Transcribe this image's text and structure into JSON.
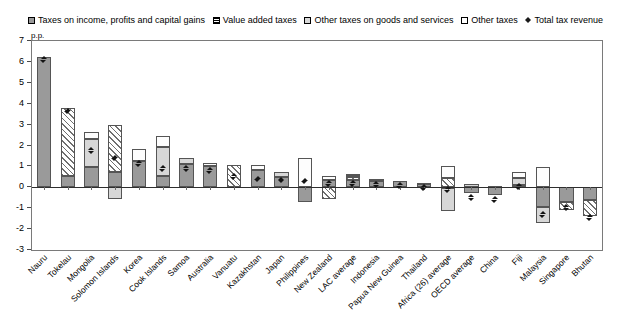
{
  "legend": {
    "items": [
      {
        "label": "Taxes on income, profits and capital gains",
        "marker": "square-hatch-icon",
        "key": "income"
      },
      {
        "label": "Value added taxes",
        "marker": "square-lines-icon",
        "key": "vat"
      },
      {
        "label": "Other taxes on goods and services",
        "marker": "square-grey-icon",
        "key": "goods"
      },
      {
        "label": "Other taxes",
        "marker": "square-white-icon",
        "key": "other"
      },
      {
        "label": "Total tax revenue",
        "marker": "diamond-icon",
        "key": "total"
      }
    ]
  },
  "axis": {
    "unit_label": "p.p.",
    "y_ticks": [
      "7",
      "6",
      "5",
      "4",
      "3",
      "2",
      "1",
      "0",
      "-1",
      "-2",
      "-3"
    ]
  },
  "chart_data": {
    "type": "bar",
    "title": "",
    "xlabel": "",
    "ylabel": "p.p.",
    "ylim": [
      -3,
      7
    ],
    "grid": false,
    "stacked": true,
    "legend_position": "top",
    "categories": [
      "Nauru",
      "Tokelau",
      "Mongolia",
      "Solomon Islands",
      "Korea",
      "Cook Islands",
      "Samoa",
      "Australia",
      "Vanuatu",
      "Kazakhstan",
      "Japan",
      "Philippines",
      "New Zealand",
      "LAC average",
      "Indonesia",
      "Papua New Guinea",
      "Thailand",
      "Africa (26) average",
      "OECD average",
      "China",
      "Fiji",
      "Malaysia",
      "Singapore",
      "Bhutan"
    ],
    "series": [
      {
        "name": "Taxes on income, profits and capital gains",
        "key": "income",
        "values": [
          6.25,
          0.55,
          0.95,
          0.75,
          1.25,
          0.55,
          1.1,
          1.0,
          0.0,
          0.85,
          0.5,
          -0.7,
          0.35,
          0.35,
          0.3,
          0.3,
          0.15,
          -0.05,
          -0.25,
          -0.35,
          0.1,
          -0.95,
          -0.7,
          -0.6
        ]
      },
      {
        "name": "Value added taxes",
        "key": "vat",
        "values": [
          0.0,
          3.25,
          0.0,
          2.25,
          0.0,
          0.0,
          0.0,
          0.0,
          1.05,
          0.0,
          0.0,
          0.0,
          -0.55,
          0.15,
          0.0,
          0.0,
          0.0,
          0.45,
          0.0,
          0.0,
          0.0,
          0.0,
          -0.4,
          -0.75
        ]
      },
      {
        "name": "Other taxes on goods and services",
        "key": "goods",
        "values": [
          0.0,
          0.0,
          1.35,
          -0.55,
          0.0,
          1.4,
          0.3,
          0.0,
          0.0,
          0.0,
          0.25,
          0.0,
          0.0,
          0.1,
          0.1,
          0.0,
          0.05,
          -1.1,
          0.15,
          0.05,
          0.35,
          -0.75,
          0.0,
          0.0
        ]
      },
      {
        "name": "Other taxes",
        "key": "other",
        "values": [
          0.0,
          0.0,
          0.35,
          0.0,
          0.6,
          0.5,
          0.0,
          0.15,
          0.0,
          0.2,
          0.0,
          1.4,
          0.2,
          0.05,
          0.0,
          0.0,
          0.0,
          0.55,
          0.0,
          0.0,
          0.3,
          0.95,
          0.0,
          0.0
        ]
      }
    ],
    "total_series": {
      "name": "Total tax revenue",
      "key": "total",
      "marker": "diamond",
      "values": [
        6.3,
        3.85,
        1.95,
        1.6,
        1.35,
        1.1,
        1.1,
        1.0,
        0.7,
        0.6,
        0.55,
        0.5,
        0.4,
        0.4,
        0.35,
        0.3,
        0.2,
        0.1,
        -0.3,
        -0.4,
        0.25,
        -1.1,
        -0.75,
        -1.25
      ]
    }
  }
}
